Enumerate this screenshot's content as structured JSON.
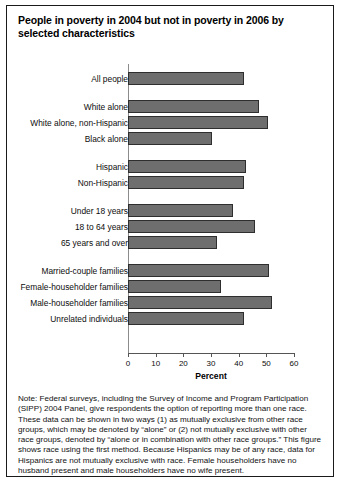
{
  "figure": {
    "title": "People in poverty in 2004 but not in poverty in 2006 by selected characteristics",
    "note": "Note: Federal surveys, including the Survey of Income and Program Participation (SIPP) 2004 Panel, give respondents the option of reporting more than one race. These data can be shown in two ways (1) as mutually exclusive from other race groups, which may be denoted by “alone” or (2) not mutually exclusive with other race groups, denoted by “alone or in combination with other race groups.” This figure shows race using the first method. Because Hispanics may be of any race, data for Hispanics are not mutually exclusive with race. Female householders have no husband present and male householders have no wife present.",
    "cut_text": "Dashed text cut off at page edge",
    "bar_color": "#6e6e6e",
    "border_color": "#2e2e2e"
  },
  "chart_data": {
    "type": "bar",
    "orientation": "horizontal",
    "title": "People in poverty in 2004 but not in poverty in 2006 by selected characteristics",
    "xlabel": "Percent",
    "ylabel": "",
    "xlim": [
      0,
      60
    ],
    "xticks": [
      0,
      10,
      20,
      30,
      40,
      50,
      60
    ],
    "xtick_labels": [
      "0",
      "10",
      "20",
      "30",
      "40",
      "50",
      "60"
    ],
    "grid": false,
    "legend": false,
    "categories": [
      "All people",
      "White alone",
      "White alone, non-Hispanic",
      "Black alone",
      "Hispanic",
      "Non-Hispanic",
      "Under 18 years",
      "18 to 64 years",
      "65 years and over",
      "Married-couple families",
      "Female-householder families",
      "Male-householder families",
      "Unrelated individuals"
    ],
    "values": [
      42.1,
      47.2,
      50.6,
      30.2,
      42.8,
      42.1,
      38.1,
      45.9,
      32.1,
      50.9,
      33.6,
      51.9,
      42.1
    ],
    "groups": [
      {
        "start": 0,
        "count": 1
      },
      {
        "start": 1,
        "count": 3
      },
      {
        "start": 4,
        "count": 2
      },
      {
        "start": 6,
        "count": 3
      },
      {
        "start": 9,
        "count": 4
      }
    ]
  }
}
